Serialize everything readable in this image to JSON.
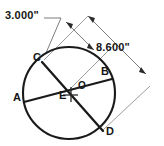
{
  "figure": {
    "type": "geometry-diagram",
    "background_color": "#ffffff",
    "line_color": "#1a1a1a",
    "dimension_color": "#6e6e6e"
  },
  "dimensions": [
    {
      "id": "dim-3000",
      "value": "3.000\"",
      "label_x": 5,
      "label_y": 14
    },
    {
      "id": "dim-8600",
      "value": "8.600\"",
      "label_x": 96,
      "label_y": 46
    }
  ],
  "points": [
    {
      "id": "point-c",
      "label": "C",
      "x": 33,
      "y": 52,
      "cx": 44,
      "cy": 62
    },
    {
      "id": "point-b",
      "label": "B",
      "x": 101,
      "y": 66,
      "cx": 110,
      "cy": 80
    },
    {
      "id": "point-a",
      "label": "A",
      "x": 13,
      "y": 92,
      "cx": 25,
      "cy": 102
    },
    {
      "id": "point-e",
      "label": "E",
      "x": 59,
      "y": 90,
      "cx": 69,
      "cy": 87
    },
    {
      "id": "point-o",
      "label": "O",
      "x": 78,
      "y": 81,
      "cx": 69,
      "cy": 93
    },
    {
      "id": "point-d",
      "label": "D",
      "x": 106,
      "y": 126,
      "cx": 101,
      "cy": 130
    }
  ],
  "circle": {
    "center_x": 69,
    "center_y": 93,
    "radius": 46
  },
  "chords": [
    {
      "id": "chord-ab",
      "from": "A",
      "to": "B",
      "x1": 24,
      "y1": 102,
      "x2": 112,
      "y2": 79
    },
    {
      "id": "chord-cd",
      "from": "C",
      "to": "D",
      "x1": 42,
      "y1": 62,
      "x2": 103,
      "y2": 131
    }
  ],
  "annotations": {
    "center_mark": "cross-at-center-o",
    "intersection": "E"
  }
}
